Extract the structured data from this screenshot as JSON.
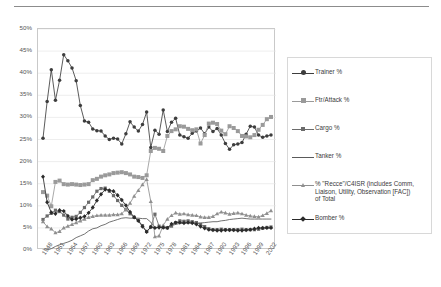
{
  "page": {
    "background": "#ffffff",
    "rule_color": "#8c8c8c"
  },
  "chart_data": {
    "type": "line",
    "title": "",
    "subtitle": "",
    "xlabel": "",
    "ylabel": "",
    "ylim": [
      0,
      50
    ],
    "ytick_labels": [
      "0%",
      "5%",
      "10%",
      "15%",
      "20%",
      "25%",
      "30%",
      "35%",
      "40%",
      "45%",
      "50%"
    ],
    "ytick_values": [
      0,
      5,
      10,
      15,
      20,
      25,
      30,
      35,
      40,
      45,
      50
    ],
    "grid": "horizontal",
    "legend_position": "right",
    "x": [
      1948,
      1949,
      1950,
      1951,
      1952,
      1953,
      1954,
      1955,
      1956,
      1957,
      1958,
      1959,
      1960,
      1961,
      1962,
      1963,
      1964,
      1965,
      1966,
      1967,
      1968,
      1969,
      1970,
      1971,
      1972,
      1973,
      1974,
      1975,
      1976,
      1977,
      1978,
      1979,
      1980,
      1981,
      1982,
      1983,
      1984,
      1985,
      1986,
      1987,
      1988,
      1989,
      1990,
      1991,
      1992,
      1993,
      1994,
      1995,
      1996,
      1997,
      1998,
      1999,
      2000,
      2001,
      2002,
      2003
    ],
    "xtick_labels": [
      "1948",
      "1951",
      "1954",
      "1957",
      "1960",
      "1963",
      "1966",
      "1969",
      "1972",
      "1975",
      "1978",
      "1981",
      "1984",
      "1987",
      "1990",
      "1993",
      "1996",
      "1999",
      "2002"
    ],
    "xtick_values": [
      1948,
      1951,
      1954,
      1957,
      1960,
      1963,
      1966,
      1969,
      1972,
      1975,
      1978,
      1981,
      1984,
      1987,
      1990,
      1993,
      1996,
      1999,
      2002
    ],
    "series": [
      {
        "name": "Trainer %",
        "color": "#3d3d3d",
        "marker": "circle",
        "values": [
          25.3,
          33.6,
          40.8,
          33.9,
          38.4,
          44.2,
          42.8,
          41.2,
          38.3,
          32.7,
          29.2,
          28.9,
          27.4,
          27.0,
          26.9,
          25.8,
          25.0,
          25.3,
          25.1,
          24.0,
          26.3,
          29.0,
          27.8,
          26.9,
          28.4,
          31.2,
          23.2,
          27.1,
          26.2,
          31.7,
          26.8,
          28.9,
          29.8,
          26.0,
          25.6,
          25.3,
          26.4,
          26.9,
          27.6,
          26.3,
          27.8,
          26.8,
          27.5,
          26.0,
          24.1,
          22.8,
          23.8,
          24.0,
          24.3,
          26.2,
          28.0,
          27.8,
          26.0,
          25.5,
          25.8,
          26.0
        ]
      },
      {
        "name": "Ftr/Attack %",
        "color": "#9a9a9a",
        "marker": "square",
        "values": [
          13.1,
          12.3,
          9.9,
          15.4,
          15.7,
          14.9,
          14.8,
          14.9,
          14.8,
          14.7,
          14.8,
          14.9,
          15.8,
          16.1,
          16.6,
          16.9,
          17.1,
          17.4,
          17.5,
          17.6,
          17.4,
          17.1,
          16.6,
          16.5,
          16.3,
          16.9,
          22.4,
          23.1,
          22.9,
          22.4,
          25.8,
          26.9,
          27.3,
          28.0,
          27.9,
          27.4,
          27.1,
          27.3,
          24.1,
          26.0,
          28.6,
          28.8,
          28.5,
          27.0,
          26.2,
          28.0,
          27.6,
          26.9,
          25.8,
          25.7,
          25.5,
          26.0,
          27.2,
          28.3,
          29.6,
          30.1
        ]
      },
      {
        "name": "Cargo %",
        "color": "#6b6b6b",
        "marker": "square-small",
        "values": [
          6.9,
          7.7,
          8.3,
          9.0,
          8.7,
          7.9,
          7.0,
          7.4,
          7.6,
          8.5,
          9.6,
          10.8,
          12.0,
          13.3,
          13.9,
          14.0,
          13.3,
          12.3,
          11.2,
          10.1,
          9.1,
          8.2,
          7.4,
          6.7,
          5.5,
          4.2,
          5.2,
          8.1,
          5.4,
          5.1,
          5.0,
          5.4,
          6.2,
          6.6,
          6.5,
          6.6,
          6.4,
          6.2,
          5.8,
          5.3,
          4.8,
          4.6,
          4.6,
          4.7,
          4.6,
          4.6,
          4.6,
          4.6,
          4.7,
          4.6,
          4.6,
          4.6,
          4.7,
          4.9,
          5.1,
          5.2
        ]
      },
      {
        "name": "Tanker %",
        "color": "#5a5a5a",
        "marker": "none",
        "values": [
          0.0,
          0.0,
          0.3,
          0.8,
          1.2,
          1.5,
          1.8,
          2.2,
          2.8,
          3.2,
          3.6,
          4.3,
          4.8,
          5.0,
          5.5,
          5.8,
          6.3,
          6.6,
          6.9,
          7.2,
          7.3,
          7.2,
          7.2,
          7.2,
          7.1,
          7.1,
          6.3,
          5.1,
          5.2,
          5.2,
          5.2,
          5.5,
          5.8,
          6.0,
          6.1,
          6.1,
          6.1,
          6.1,
          6.1,
          6.2,
          6.3,
          6.4,
          6.4,
          6.6,
          6.7,
          6.9,
          7.0,
          7.1,
          7.2,
          7.1,
          7.0,
          7.0,
          7.0,
          7.0,
          7.0,
          7.0
        ]
      },
      {
        "name": "% \"Recce\"/C4ISR (includes Comm, Liaison, Utility, Observation [FAC]) of Total",
        "color": "#8f8f8f",
        "marker": "triangle",
        "values": [
          6.4,
          5.3,
          4.8,
          3.9,
          4.2,
          5.0,
          5.4,
          5.8,
          6.2,
          6.6,
          7.0,
          7.4,
          7.6,
          7.8,
          7.9,
          7.9,
          7.9,
          8.0,
          8.0,
          8.2,
          9.2,
          10.6,
          12.2,
          13.5,
          14.8,
          16.0,
          11.0,
          3.0,
          3.2,
          5.6,
          7.0,
          7.8,
          8.4,
          8.1,
          8.2,
          8.0,
          7.9,
          7.8,
          7.5,
          7.4,
          7.4,
          7.6,
          8.2,
          8.6,
          8.4,
          8.1,
          8.3,
          8.4,
          8.2,
          7.9,
          7.7,
          7.6,
          7.5,
          7.8,
          8.3,
          8.9
        ]
      },
      {
        "name": "Bomber %",
        "color": "#2b2b2b",
        "marker": "diamond",
        "values": [
          16.6,
          10.8,
          8.5,
          8.2,
          9.0,
          8.8,
          7.7,
          6.9,
          7.0,
          7.3,
          7.6,
          8.4,
          9.6,
          11.2,
          12.6,
          13.7,
          13.5,
          13.3,
          12.4,
          11.3,
          10.1,
          8.6,
          7.4,
          6.6,
          5.3,
          4.1,
          5.2,
          5.0,
          5.1,
          5.1,
          5.0,
          5.9,
          6.2,
          6.2,
          6.1,
          6.2,
          6.1,
          5.8,
          5.3,
          4.9,
          4.6,
          4.5,
          4.4,
          4.4,
          4.5,
          4.5,
          4.5,
          4.4,
          4.4,
          4.5,
          4.6,
          4.8,
          5.0,
          5.0,
          5.0,
          5.0
        ]
      }
    ]
  },
  "legend": {
    "items": [
      {
        "label": "Trainer %",
        "marker": "circle",
        "color": "#3d3d3d"
      },
      {
        "label": "Ftr/Attack %",
        "marker": "square",
        "color": "#9a9a9a"
      },
      {
        "label": "Cargo %",
        "marker": "square-small",
        "color": "#6b6b6b"
      },
      {
        "label": "Tanker %",
        "marker": "none",
        "color": "#5a5a5a"
      },
      {
        "label": "% \"Recce\"/C4ISR (includes Comm,\nLiaison, Utility, Observation [FAC])\nof Total",
        "marker": "triangle",
        "color": "#8f8f8f"
      },
      {
        "label": "Bomber %",
        "marker": "diamond",
        "color": "#2b2b2b"
      }
    ]
  }
}
